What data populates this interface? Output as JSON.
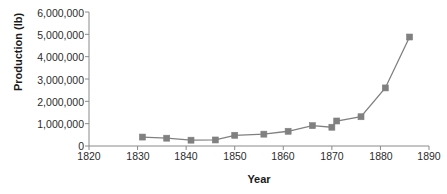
{
  "chart_data": {
    "type": "line",
    "title": "",
    "xlabel": "Year",
    "ylabel": "Production (lb)",
    "xlim": [
      1820,
      1890
    ],
    "ylim": [
      0,
      6000000
    ],
    "grid": false,
    "legend": "none",
    "marker": "square",
    "series_color": "#808080",
    "x": [
      1831,
      1836,
      1841,
      1846,
      1850,
      1856,
      1861,
      1866,
      1870,
      1871,
      1876,
      1881,
      1886
    ],
    "values": [
      400000,
      350000,
      260000,
      270000,
      480000,
      530000,
      660000,
      910000,
      840000,
      1120000,
      1310000,
      2600000,
      4880000
    ],
    "series": [
      {
        "name": "Production (lb)",
        "x": [
          1831,
          1836,
          1841,
          1846,
          1850,
          1856,
          1861,
          1866,
          1870,
          1871,
          1876,
          1881,
          1886
        ],
        "values": [
          400000,
          350000,
          260000,
          270000,
          480000,
          530000,
          660000,
          910000,
          840000,
          1120000,
          1310000,
          2600000,
          4880000
        ]
      }
    ],
    "xticks": [
      1820,
      1830,
      1840,
      1850,
      1860,
      1870,
      1880,
      1890
    ],
    "xtick_labels": [
      "1820",
      "1830",
      "1840",
      "1850",
      "1860",
      "1870",
      "1880",
      "1890"
    ],
    "yticks": [
      0,
      1000000,
      2000000,
      3000000,
      4000000,
      5000000,
      6000000
    ],
    "ytick_labels": [
      "0",
      "1,000,000",
      "2,000,000",
      "3,000,000",
      "4,000,000",
      "5,000,000",
      "6,000,000"
    ]
  },
  "axis": {
    "x_title": "Year",
    "y_title": "Production (lb)"
  },
  "colors": {
    "series": "#808080",
    "axis": "#8a8a8a",
    "text": "#2b2b2b"
  }
}
